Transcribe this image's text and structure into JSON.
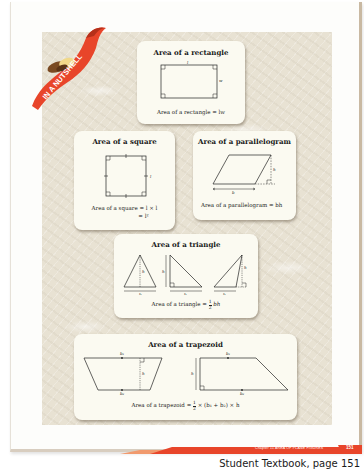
{
  "page": {
    "ribbon_label": "IN A NUTSHELL",
    "footer": {
      "chapter": "Chapter 11  AREA OF PLANE FIGURES",
      "page_number": "151"
    },
    "caption": "Student Textbook, page 151",
    "colors": {
      "accent": "#e8452a",
      "card_bg": "#fbfaf1",
      "texture_bg": "#e8e2d3"
    }
  },
  "cards": {
    "rectangle": {
      "title": "Area of a rectangle",
      "formula": "Area of a rectangle = lw",
      "labels": {
        "length": "l",
        "width": "w"
      }
    },
    "square": {
      "title": "Area of a square",
      "formula_line1": "Area of a square = l × l",
      "formula_line2": "= l²",
      "labels": {
        "side": "l"
      }
    },
    "parallelogram": {
      "title": "Area of a parallelogram",
      "formula": "Area of a parallelogram = bh",
      "labels": {
        "base": "b",
        "height": "h"
      }
    },
    "triangle": {
      "title": "Area of a triangle",
      "formula_prefix": "Area of a triangle =",
      "formula_frac_num": "1",
      "formula_frac_den": "2",
      "formula_suffix": "bh",
      "labels": {
        "base": "b",
        "height": "h"
      }
    },
    "trapezoid": {
      "title": "Area of a trapezoid",
      "formula_prefix": "Area of a trapezoid =",
      "formula_frac_num": "1",
      "formula_frac_den": "2",
      "formula_suffix": "× (b₁ + b₂) × h",
      "labels": {
        "base1": "b₁",
        "base2": "b₂",
        "height": "h"
      }
    }
  }
}
